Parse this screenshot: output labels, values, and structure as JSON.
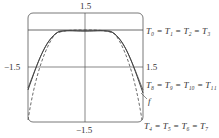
{
  "axes": {
    "y_top": "1.5",
    "x_left": "−1.5",
    "x_right": "1.5",
    "y_bottom": "−1.5"
  },
  "curves": {
    "t0_label": "T₀ = T₁ = T₂ = T₃",
    "t8_label": "T₈ = T₉ = T₁₀ = T₁₁",
    "f_label": "f",
    "t4_label": "T₄ = T₅ = T₆ = T₇"
  }
}
